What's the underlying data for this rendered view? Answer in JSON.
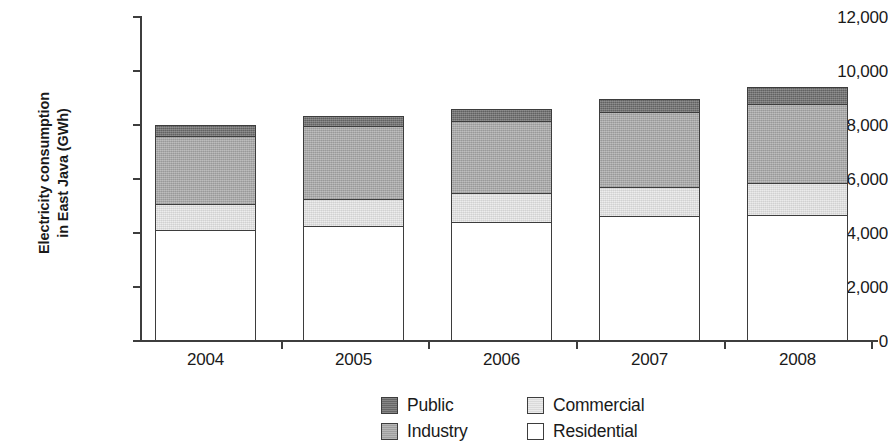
{
  "chart_data": {
    "type": "bar",
    "stacked": true,
    "title": "",
    "xlabel": "",
    "ylabel": "Electricity consumption in East Java (GWh)",
    "ylabel_lines": [
      "Electricity consumption",
      "in East Java (GWh)"
    ],
    "categories": [
      "2004",
      "2005",
      "2006",
      "2007",
      "2008"
    ],
    "ylim": [
      0,
      12000
    ],
    "ytick_values": [
      0,
      2000,
      4000,
      6000,
      8000,
      10000,
      12000
    ],
    "ytick_labels": [
      "0",
      "2,000",
      "4,000",
      "6,000",
      "8,000",
      "10,000",
      "12,000"
    ],
    "grid": false,
    "legend_position": "bottom",
    "series": [
      {
        "name": "Residential",
        "color": "#ffffff",
        "values": [
          4111,
          4259,
          4407,
          4630,
          4667
        ]
      },
      {
        "name": "Commercial",
        "color": "#e6e6e6",
        "values": [
          1000,
          1037,
          1111,
          1111,
          1222
        ]
      },
      {
        "name": "Industry",
        "color": "#a8a8a8",
        "values": [
          2589,
          2778,
          2741,
          2852,
          3000
        ]
      },
      {
        "name": "Public",
        "color": "#6b6b6b",
        "values": [
          448,
          407,
          482,
          518,
          667
        ]
      }
    ],
    "totals": [
      8148,
      8481,
      8741,
      9111,
      9556
    ],
    "legend_entries": [
      {
        "label": "Public",
        "color": "#6b6b6b"
      },
      {
        "label": "Commercial",
        "color": "#e6e6e6"
      },
      {
        "label": "Industry",
        "color": "#a8a8a8"
      },
      {
        "label": "Residential",
        "color": "#ffffff"
      }
    ]
  }
}
